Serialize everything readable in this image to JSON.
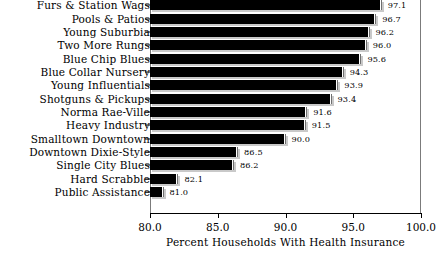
{
  "chart_data": {
    "type": "bar",
    "orientation": "horizontal",
    "title": "",
    "xlabel": "Percent Households With Health Insurance",
    "ylabel": "",
    "xlim": [
      80.0,
      100.0
    ],
    "xticks": [
      "80.0",
      "85.0",
      "90.0",
      "95.0",
      "100.0"
    ],
    "xtick_values": [
      80.0,
      85.0,
      90.0,
      95.0,
      100.0
    ],
    "grid": false,
    "legend": null,
    "categories": [
      "Furs & Station Wags",
      "Pools & Patios",
      "Young Suburbia",
      "Two More Rungs",
      "Blue Chip Blues",
      "Blue Collar Nursery",
      "Young Influentials",
      "Shotguns & Pickups",
      "Norma Rae-Ville",
      "Heavy Industry",
      "Smalltown Downtown",
      "Downtown Dixie-Style",
      "Single City Blues",
      "Hard Scrabble",
      "Public Assistance"
    ],
    "values": [
      97.1,
      96.7,
      96.2,
      96.0,
      95.6,
      94.3,
      93.9,
      93.4,
      91.6,
      91.5,
      90.0,
      86.5,
      86.2,
      82.1,
      81.0
    ],
    "value_labels": [
      "97.1",
      "96.7",
      "96.2",
      "96.0",
      "95.6",
      "94.3",
      "93.9",
      "93.4",
      "91.6",
      "91.5",
      "90.0",
      "86.5",
      "86.2",
      "82.1",
      "81.0"
    ],
    "bar_color": "#000000",
    "frame_color": "#7b7b7b",
    "background": "#ffffff"
  }
}
